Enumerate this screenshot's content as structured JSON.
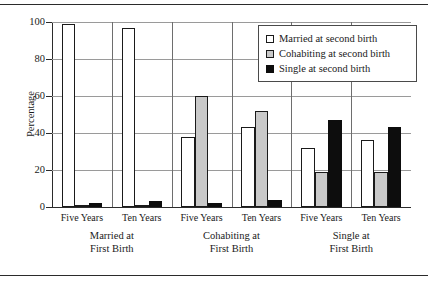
{
  "chart_data": {
    "type": "bar",
    "title": "",
    "xlabel": "",
    "ylabel": "Percentage",
    "ylim": [
      0,
      100
    ],
    "yticks": [
      0,
      20,
      40,
      60,
      80,
      100
    ],
    "grid": true,
    "legend_position": "top-right",
    "categories": [
      "Five Years",
      "Ten Years",
      "Five Years",
      "Ten Years",
      "Five Years",
      "Ten Years"
    ],
    "groups": [
      {
        "label_line1": "Married at",
        "label_line2": "First Birth",
        "categories": [
          "Five Years",
          "Ten Years"
        ]
      },
      {
        "label_line1": "Cohabiting at",
        "label_line2": "First Birth",
        "categories": [
          "Five Years",
          "Ten Years"
        ]
      },
      {
        "label_line1": "Single at",
        "label_line2": "First Birth",
        "categories": [
          "Five Years",
          "Ten Years"
        ]
      }
    ],
    "series": [
      {
        "name": "Married at second birth",
        "color": "#ffffff",
        "values": [
          99,
          97,
          38,
          43,
          32,
          36
        ]
      },
      {
        "name": "Cohabiting at second birth",
        "color": "#c9c9c9",
        "values": [
          1,
          1,
          60,
          52,
          19,
          19
        ]
      },
      {
        "name": "Single at second birth",
        "color": "#0d0d0d",
        "values": [
          2,
          3,
          2,
          4,
          47,
          43
        ]
      }
    ]
  },
  "legend": {
    "items": [
      {
        "label": "Married at second birth",
        "swatch": "married"
      },
      {
        "label": "Cohabiting at second birth",
        "swatch": "cohab"
      },
      {
        "label": "Single at second birth",
        "swatch": "single"
      }
    ]
  },
  "axis": {
    "y_label": "Percentage",
    "y_ticks": [
      "0",
      "20",
      "40",
      "60",
      "80",
      "100"
    ]
  }
}
